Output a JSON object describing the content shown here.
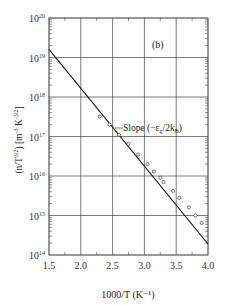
{
  "chart_data": {
    "type": "line",
    "title": "",
    "panel_label": "(b)",
    "xlabel": "1000/T (K⁻¹)",
    "ylabel": "(n/T³ᐟ²) [m⁻³ K⁻³ᐟ²]",
    "ylabel_parts": {
      "main": "(n/T",
      "exp1": "3/2",
      "mid": ") [m",
      "exp2": "-3",
      "k": " K",
      "exp3": "-3/2",
      "end": "]"
    },
    "xlim": [
      1.5,
      4.0
    ],
    "ylim": [
      100000000000000.0,
      1e+20
    ],
    "yscale": "log",
    "grid": true,
    "x_ticks": [
      "1.5",
      "2.0",
      "2.5",
      "3.0",
      "3.5",
      "4.0"
    ],
    "y_ticks": [
      {
        "base": "10",
        "exp": "20"
      },
      {
        "base": "10",
        "exp": "19"
      },
      {
        "base": "10",
        "exp": "18"
      },
      {
        "base": "10",
        "exp": "17"
      },
      {
        "base": "10",
        "exp": "16"
      },
      {
        "base": "10",
        "exp": "15"
      },
      {
        "base": "10",
        "exp": "14"
      }
    ],
    "series": [
      {
        "name": "fit line",
        "style": "solid",
        "x": [
          1.5,
          4.0
        ],
        "y": [
          1.6e+19,
          190000000000000.0
        ]
      },
      {
        "name": "measured data",
        "style": "open-circles",
        "x": [
          2.3,
          2.45,
          2.6,
          2.75,
          2.9,
          3.05,
          3.15,
          3.25,
          3.3,
          3.45,
          3.55,
          3.7,
          3.8,
          3.9
        ],
        "y": [
          3.2e+17,
          2e+17,
          1.1e+17,
          6.5e+16,
          3.5e+16,
          2e+16,
          1.3e+16,
          9000000000000000.0,
          7000000000000000.0,
          4200000000000000.0,
          2800000000000000.0,
          1600000000000000.0,
          1000000000000000.0,
          650000000000000.0
        ]
      }
    ],
    "annotations": [
      {
        "text": "Slope (−εg/2kB)",
        "at_x": 2.5,
        "at_y": 2e+17
      }
    ]
  },
  "annotation": {
    "slope_prefix": "Slope (−ε",
    "slope_sub1": "g",
    "slope_mid": "/2k",
    "slope_sub2": "B",
    "slope_end": ")"
  }
}
